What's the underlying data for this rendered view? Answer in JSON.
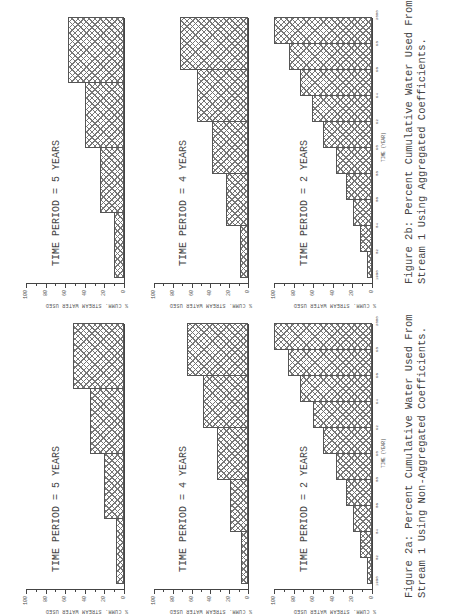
{
  "figures": [
    {
      "id": "2a",
      "caption_line1": "Figure 2a: Percent Cumulative Water Used From",
      "caption_line2": "Stream 1 Using Non-Aggregated Coefficients."
    },
    {
      "id": "2b",
      "caption_line1": "Figure 2b: Percent Cumulative Water Used From",
      "caption_line2": "Stream 1 Using Aggregated Coefficients."
    }
  ],
  "axis": {
    "ylabel": "% CUMM. STREAM WATER USED",
    "yticks": [
      "0",
      "20",
      "40",
      "60",
      "80",
      "100"
    ],
    "xlabel": "TIME (YEAR)",
    "xticks": [
      "1980",
      "82",
      "84",
      "86",
      "88",
      "90",
      "92",
      "94",
      "96",
      "98",
      "2000"
    ]
  },
  "titles": {
    "p5": "TIME PERIOD = 5 YEARS",
    "p4": "TIME PERIOD = 4 YEARS",
    "p2": "TIME PERIOD = 2 YEARS"
  },
  "chart_data": [
    {
      "type": "bar",
      "figure": "Figure 2a: Percent Cumulative Water Used From Stream 1 Using Non-Aggregated Coefficients.",
      "title": "TIME PERIOD = 5 YEARS",
      "xlabel": "TIME (YEAR)",
      "ylabel": "% CUMM. STREAM WATER USED",
      "ylim": [
        0,
        100
      ],
      "categories": [
        "1980-85",
        "1985-90",
        "1990-95",
        "1995-2000"
      ],
      "values": [
        8,
        20,
        35,
        52
      ]
    },
    {
      "type": "bar",
      "figure": "Figure 2a",
      "title": "TIME PERIOD = 4 YEARS",
      "xlabel": "TIME (YEAR)",
      "ylabel": "% CUMM. STREAM WATER USED",
      "ylim": [
        0,
        100
      ],
      "categories": [
        "1980-84",
        "1984-88",
        "1988-92",
        "1992-96",
        "1996-2000"
      ],
      "values": [
        7,
        19,
        33,
        48,
        65
      ]
    },
    {
      "type": "bar",
      "figure": "Figure 2a",
      "title": "TIME PERIOD = 2 YEARS",
      "xlabel": "TIME (YEAR)",
      "ylabel": "% CUMM. STREAM WATER USED",
      "ylim": [
        0,
        100
      ],
      "categories": [
        "1980",
        "82",
        "84",
        "86",
        "88",
        "90",
        "92",
        "94",
        "96",
        "98"
      ],
      "values": [
        5,
        12,
        19,
        27,
        37,
        50,
        60,
        73,
        86,
        100
      ]
    },
    {
      "type": "bar",
      "figure": "Figure 2b: Percent Cumulative Water Used From Stream 1 Using Aggregated Coefficients.",
      "title": "TIME PERIOD = 5 YEARS",
      "xlabel": "TIME (YEAR)",
      "ylabel": "% CUMM. STREAM WATER USED",
      "ylim": [
        0,
        100
      ],
      "categories": [
        "1980-85",
        "1985-90",
        "1990-95",
        "1995-2000"
      ],
      "values": [
        10,
        24,
        40,
        57
      ]
    },
    {
      "type": "bar",
      "figure": "Figure 2b",
      "title": "TIME PERIOD = 4 YEARS",
      "xlabel": "TIME (YEAR)",
      "ylabel": "% CUMM. STREAM WATER USED",
      "ylim": [
        0,
        100
      ],
      "categories": [
        "1980-84",
        "1984-88",
        "1988-92",
        "1992-96",
        "1996-2000"
      ],
      "values": [
        9,
        23,
        38,
        54,
        72
      ]
    },
    {
      "type": "bar",
      "figure": "Figure 2b",
      "title": "TIME PERIOD = 2 YEARS",
      "xlabel": "TIME (YEAR)",
      "ylabel": "% CUMM. STREAM WATER USED",
      "ylim": [
        0,
        100
      ],
      "categories": [
        "1980",
        "82",
        "84",
        "86",
        "88",
        "90",
        "92",
        "94",
        "96",
        "98"
      ],
      "values": [
        5,
        12,
        19,
        27,
        37,
        50,
        61,
        73,
        85,
        100
      ]
    }
  ]
}
